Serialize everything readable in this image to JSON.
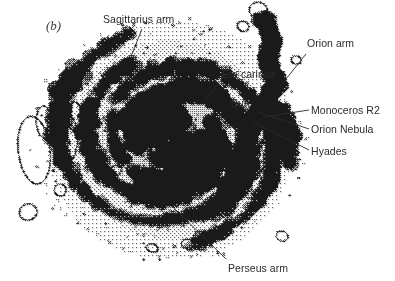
{
  "figure": {
    "panel_letter": "(b)",
    "background_color": "#ffffff",
    "ink_color": "#1a1a1a",
    "label_color": "#2b2b2b",
    "width": 395,
    "height": 281
  },
  "labels": [
    {
      "id": "sagittarius-arm",
      "text": "Sagittarius arm",
      "x": 103,
      "y": 14,
      "anchor": "start"
    },
    {
      "id": "eta-carinae",
      "text": "Eta carinae",
      "x": 222,
      "y": 69,
      "anchor": "start"
    },
    {
      "id": "sun",
      "text": "Sun",
      "x": 231,
      "y": 98,
      "anchor": "start"
    },
    {
      "id": "orion-arm",
      "text": "Orion arm",
      "x": 307,
      "y": 38,
      "anchor": "start"
    },
    {
      "id": "monoceros-r2",
      "text": "Monoceros R2",
      "x": 311,
      "y": 105,
      "anchor": "start"
    },
    {
      "id": "orion-nebula",
      "text": "Orion Nebula",
      "x": 311,
      "y": 124,
      "anchor": "start"
    },
    {
      "id": "hyades",
      "text": "Hyades",
      "x": 311,
      "y": 146,
      "anchor": "start"
    },
    {
      "id": "perseus-arm",
      "text": "Perseus arm",
      "x": 228,
      "y": 263,
      "anchor": "start"
    }
  ],
  "leader_lines": [
    {
      "id": "leader-sagittarius-arm",
      "x1": 142,
      "y1": 29,
      "x2": 132,
      "y2": 54
    },
    {
      "id": "leader-eta-carinae",
      "x1": 222,
      "y1": 79,
      "x2": 206,
      "y2": 99
    },
    {
      "id": "leader-orion-arm",
      "x1": 306,
      "y1": 54,
      "x2": 278,
      "y2": 89
    },
    {
      "id": "leader-monoceros-r2",
      "x1": 309,
      "y1": 110,
      "x2": 263,
      "y2": 117
    },
    {
      "id": "leader-orion-nebula",
      "x1": 309,
      "y1": 129,
      "x2": 258,
      "y2": 112
    },
    {
      "id": "leader-hyades",
      "x1": 309,
      "y1": 150,
      "x2": 253,
      "y2": 122
    },
    {
      "id": "leader-perseus-arm",
      "x1": 226,
      "y1": 259,
      "x2": 172,
      "y2": 206
    }
  ],
  "chart_data": {
    "type": "scatter",
    "center": {
      "x": 170,
      "y": 140
    },
    "radius": 130,
    "arms": [
      {
        "name": "Sagittarius arm",
        "start_angle_deg": 95,
        "turns": 1.35,
        "thickness": 9,
        "density": "high"
      },
      {
        "name": "Orion arm",
        "start_angle_deg": 20,
        "turns": 1.25,
        "thickness": 7,
        "density": "high"
      },
      {
        "name": "Perseus arm",
        "start_angle_deg": 265,
        "turns": 1.3,
        "thickness": 8,
        "density": "high"
      },
      {
        "name": "Outer arm",
        "start_angle_deg": 180,
        "turns": 1.2,
        "thickness": 6,
        "density": "medium"
      }
    ],
    "features": [
      {
        "name": "Sun",
        "x": 206,
        "y": 104
      },
      {
        "name": "Eta carinae",
        "x": 204,
        "y": 100
      },
      {
        "name": "Monoceros R2",
        "x": 263,
        "y": 117
      },
      {
        "name": "Orion Nebula",
        "x": 258,
        "y": 112
      },
      {
        "name": "Hyades",
        "x": 253,
        "y": 122
      }
    ],
    "xlabel": "",
    "ylabel": "",
    "grid": false,
    "legend": "none"
  }
}
